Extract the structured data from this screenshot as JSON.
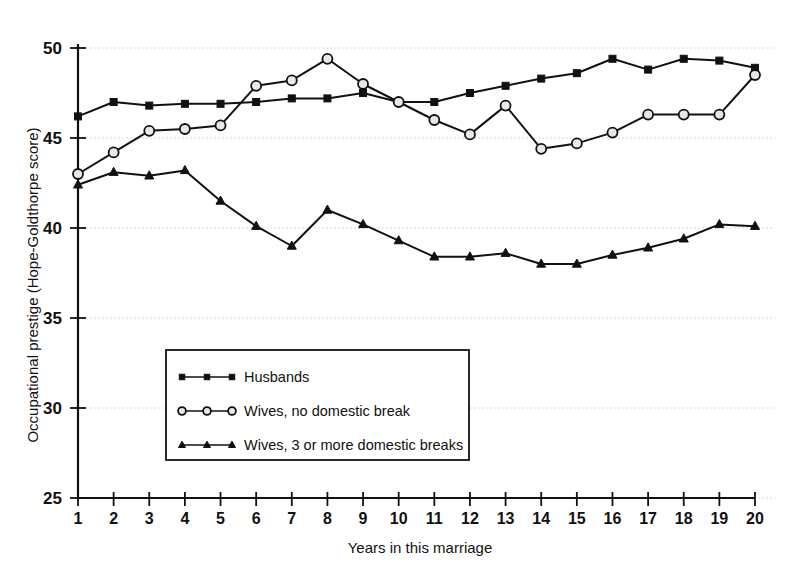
{
  "chart_data": {
    "type": "line",
    "title": "",
    "subtitle": "",
    "xlabel": "Years in this marriage",
    "ylabel": "Occupational prestige (Hope-Goldthorpe score)",
    "x": [
      1,
      2,
      3,
      4,
      5,
      6,
      7,
      8,
      9,
      10,
      11,
      12,
      13,
      14,
      15,
      16,
      17,
      18,
      19,
      20
    ],
    "categories": [
      "1",
      "2",
      "3",
      "4",
      "5",
      "6",
      "7",
      "8",
      "9",
      "10",
      "11",
      "12",
      "13",
      "14",
      "15",
      "16",
      "17",
      "18",
      "19",
      "20"
    ],
    "xlim": [
      1,
      20
    ],
    "ylim": [
      25,
      50
    ],
    "yticks": [
      25,
      30,
      35,
      40,
      45,
      50
    ],
    "xticks": [
      1,
      2,
      3,
      4,
      5,
      6,
      7,
      8,
      9,
      10,
      11,
      12,
      13,
      14,
      15,
      16,
      17,
      18,
      19,
      20
    ],
    "grid": true,
    "grid_axis": "y",
    "legend_position": "lower-left-inside",
    "series": [
      {
        "name": "Husbands",
        "marker": "filled-square",
        "color": "#111111",
        "values": [
          46.2,
          47.0,
          46.8,
          46.9,
          46.9,
          47.0,
          47.2,
          47.2,
          47.5,
          47.0,
          47.0,
          47.5,
          47.9,
          48.3,
          48.6,
          49.4,
          48.8,
          49.4,
          49.3,
          48.9
        ]
      },
      {
        "name": "Wives, no domestic break",
        "marker": "open-circle",
        "color": "#111111",
        "values": [
          43.0,
          44.2,
          45.4,
          45.5,
          45.7,
          47.9,
          48.2,
          49.4,
          48.0,
          47.0,
          46.0,
          45.2,
          46.8,
          44.4,
          44.7,
          45.3,
          46.3,
          46.3,
          46.3,
          48.5
        ]
      },
      {
        "name": "Wives, 3 or more domestic breaks",
        "marker": "filled-triangle",
        "color": "#111111",
        "values": [
          42.4,
          43.1,
          42.9,
          43.2,
          41.5,
          40.1,
          39.0,
          41.0,
          40.2,
          39.3,
          38.4,
          38.4,
          38.6,
          38.0,
          38.0,
          38.5,
          38.9,
          39.4,
          40.2,
          40.1
        ]
      }
    ]
  },
  "legend": {
    "items": [
      {
        "label": "Husbands",
        "marker": "filled-square"
      },
      {
        "label": "Wives, no domestic break",
        "marker": "open-circle"
      },
      {
        "label": "Wives, 3 or more domestic breaks",
        "marker": "filled-triangle"
      }
    ]
  },
  "colors": {
    "ink": "#111111",
    "grid": "#d8d8d8",
    "marker_fill_open": "#e8e8e8",
    "background": "#ffffff"
  }
}
